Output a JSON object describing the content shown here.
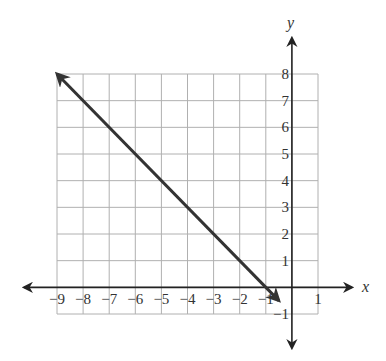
{
  "chart_data": {
    "type": "line",
    "title": "",
    "xlabel": "x",
    "ylabel": "y",
    "xlim": [
      -9,
      1
    ],
    "ylim": [
      -1,
      8
    ],
    "grid": true,
    "x_ticks": [
      "-9",
      "-8",
      "-7",
      "-6",
      "-5",
      "-4",
      "-3",
      "-2",
      "-1",
      "1"
    ],
    "y_ticks": [
      "-1",
      "1",
      "2",
      "3",
      "4",
      "5",
      "6",
      "7",
      "8"
    ],
    "series": [
      {
        "name": "y = -x - 1",
        "equation": "y = -x - 1",
        "slope": -1,
        "y_intercept": -1,
        "x_intercept": -1,
        "points": [
          [
            -9,
            8
          ],
          [
            -8,
            7
          ],
          [
            -7,
            6
          ],
          [
            -6,
            5
          ],
          [
            -5,
            4
          ],
          [
            -4,
            3
          ],
          [
            -3,
            2
          ],
          [
            -2,
            1
          ],
          [
            -1,
            0
          ],
          [
            -0.5,
            -0.5
          ]
        ],
        "arrows": "both ends",
        "color": "#333333"
      }
    ]
  },
  "colors": {
    "grid": "#b0b0b0",
    "axis": "#222222",
    "line": "#333333"
  }
}
